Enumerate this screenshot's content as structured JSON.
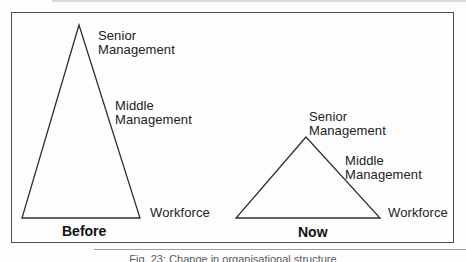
{
  "figure": {
    "before": {
      "label": "Before",
      "senior": "Senior Management",
      "middle": "Middle Management",
      "workforce": "Workforce"
    },
    "now": {
      "label": "Now",
      "senior": "Senior Management",
      "middle": "Middle Management",
      "workforce": "Workforce"
    },
    "caption": "Fig. 23: Change in organisational structure"
  },
  "colors": {
    "triangle_line": "#2e2e2e",
    "frame_border": "#4e4e4e",
    "text": "#222222",
    "caption_text": "#5a5a5a"
  }
}
